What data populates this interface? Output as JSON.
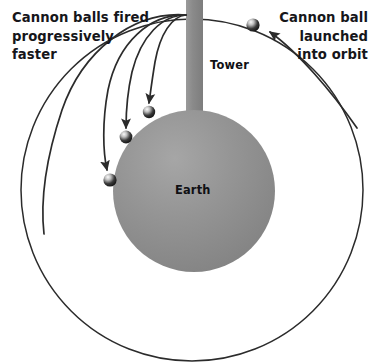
{
  "figure": {
    "width": 375,
    "height": 363,
    "background_color": "#ffffff"
  },
  "annotations": {
    "left_caption": "Cannon balls fired\nprogressively\nfaster",
    "right_caption": "Cannon ball\nlaunched\ninto orbit",
    "tower_label": "Tower",
    "earth_label": "Earth"
  },
  "colors": {
    "earth_fill": "#8c8c8c",
    "earth_highlight": "#a3a3a3",
    "tower_fill": "#8a8a8a",
    "line_color": "#2b2b2b",
    "text_color": "#16161a",
    "ball_dark": "#111111",
    "ball_highlight": "#f2f2f2"
  },
  "diagram": {
    "type": "physics-illustration",
    "earth": {
      "label": "Earth",
      "center_x": 194,
      "center_y": 191,
      "radius": 81
    },
    "orbit_circle": {
      "center_x": 192,
      "center_y": 190,
      "radius": 171,
      "stroke_width": 1.5
    },
    "tower": {
      "label": "Tower",
      "x": 186,
      "y": 0,
      "width": 17,
      "height": 118,
      "launch_point_x": 186,
      "launch_point_y": 15
    },
    "trajectories": [
      {
        "id": "trajectory-1",
        "description": "shortest fall, slowest launch",
        "path": "M 186 15 C 172 16 160 34 155 62 C 152 80 150 96 149 104",
        "impact_x": 149,
        "impact_y": 112
      },
      {
        "id": "trajectory-2",
        "description": "medium fall",
        "path": "M 186 15 C 162 15 141 36 132 72 C 127 94 126 118 126 129",
        "impact_x": 126,
        "impact_y": 137
      },
      {
        "id": "trajectory-3",
        "description": "longer fall",
        "path": "M 186 15 C 150 14 118 42 108 90 C 101 124 103 154 108 172",
        "impact_x": 110,
        "impact_y": 180
      },
      {
        "id": "trajectory-4",
        "description": "fastest launch, escapes past the horizon",
        "path": "M 186 15 C 132 11 82 52 62 110 C 44 162 40 196 44 232"
      }
    ],
    "cannonballs": [
      {
        "id": "cannonball-1",
        "cx": 149,
        "cy": 112,
        "r": 6.2
      },
      {
        "id": "cannonball-2",
        "cx": 126,
        "cy": 137,
        "r": 6.4
      },
      {
        "id": "cannonball-3",
        "cx": 110,
        "cy": 180,
        "r": 6.6
      },
      {
        "id": "cannonball-orbit",
        "cx": 253,
        "cy": 25,
        "r": 6.6
      }
    ],
    "leader_arrow": {
      "id": "orbit-leader-arrow",
      "path": "M 356 126 C 330 90 296 50 268 31",
      "arrow_tip_x": 262,
      "arrow_tip_y": 28
    }
  }
}
